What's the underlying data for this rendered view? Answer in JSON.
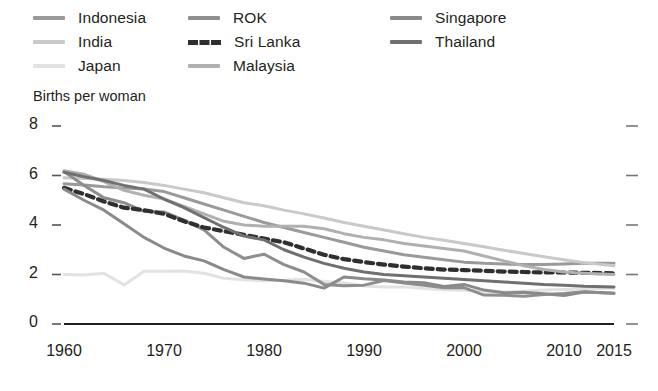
{
  "legend": {
    "columns": [
      {
        "items": [
          {
            "label": "Indonesia",
            "color": "#9a9a9a",
            "style": "solid"
          },
          {
            "label": "India",
            "color": "#c9c9c9",
            "style": "solid"
          },
          {
            "label": "Japan",
            "color": "#e2e2e2",
            "style": "solid"
          }
        ]
      },
      {
        "items": [
          {
            "label": "ROK",
            "color": "#8e8e8e",
            "style": "solid"
          },
          {
            "label": "Sri Lanka",
            "color": "#2f2f2f",
            "style": "dashed"
          },
          {
            "label": "Malaysia",
            "color": "#b0b0b0",
            "style": "solid"
          }
        ]
      },
      {
        "items": [
          {
            "label": "Singapore",
            "color": "#8a8a8a",
            "style": "solid"
          },
          {
            "label": "Thailand",
            "color": "#707070",
            "style": "solid"
          }
        ]
      }
    ]
  },
  "axes": {
    "y_title": "Births per woman",
    "y_ticks": [
      "0",
      "2",
      "4",
      "6",
      "8"
    ],
    "x_ticks": [
      "1960",
      "1970",
      "1980",
      "1990",
      "2000",
      "2010",
      "2015"
    ]
  },
  "chart_data": {
    "type": "line",
    "title": "",
    "subtitle": "",
    "xlabel": "",
    "ylabel": "Births per woman",
    "xlim": [
      1960,
      2015
    ],
    "ylim": [
      0,
      8
    ],
    "grid": false,
    "legend_position": "top",
    "x": [
      1960,
      1962,
      1964,
      1966,
      1968,
      1970,
      1972,
      1974,
      1976,
      1978,
      1980,
      1982,
      1984,
      1986,
      1988,
      1990,
      1992,
      1994,
      1996,
      1998,
      2000,
      2002,
      2004,
      2006,
      2008,
      2010,
      2012,
      2015
    ],
    "series": [
      {
        "name": "Indonesia",
        "color": "#9a9a9a",
        "style": "solid",
        "values": [
          5.67,
          5.62,
          5.55,
          5.5,
          5.45,
          5.35,
          5.1,
          4.85,
          4.6,
          4.35,
          4.1,
          3.9,
          3.7,
          3.5,
          3.3,
          3.1,
          2.95,
          2.8,
          2.7,
          2.6,
          2.5,
          2.45,
          2.42,
          2.4,
          2.4,
          2.42,
          2.45,
          2.45
        ]
      },
      {
        "name": "India",
        "color": "#c9c9c9",
        "style": "solid",
        "values": [
          5.91,
          5.88,
          5.85,
          5.8,
          5.72,
          5.6,
          5.45,
          5.3,
          5.1,
          4.9,
          4.78,
          4.6,
          4.45,
          4.28,
          4.1,
          3.95,
          3.8,
          3.65,
          3.5,
          3.38,
          3.25,
          3.12,
          2.98,
          2.85,
          2.72,
          2.6,
          2.48,
          2.35
        ]
      },
      {
        "name": "Japan",
        "color": "#e2e2e2",
        "style": "solid",
        "values": [
          2.0,
          1.98,
          2.05,
          1.58,
          2.13,
          2.13,
          2.14,
          2.05,
          1.85,
          1.79,
          1.75,
          1.77,
          1.81,
          1.72,
          1.66,
          1.54,
          1.5,
          1.5,
          1.43,
          1.38,
          1.36,
          1.32,
          1.29,
          1.32,
          1.37,
          1.39,
          1.41,
          1.45
        ]
      },
      {
        "name": "ROK",
        "color": "#8e8e8e",
        "style": "solid",
        "values": [
          6.16,
          5.6,
          5.1,
          4.9,
          4.55,
          4.53,
          4.2,
          3.8,
          3.1,
          2.65,
          2.82,
          2.4,
          2.1,
          1.6,
          1.55,
          1.57,
          1.76,
          1.66,
          1.57,
          1.46,
          1.47,
          1.17,
          1.16,
          1.12,
          1.19,
          1.23,
          1.3,
          1.24
        ]
      },
      {
        "name": "Sri Lanka",
        "color": "#2f2f2f",
        "style": "dashed",
        "values": [
          5.5,
          5.25,
          4.95,
          4.7,
          4.6,
          4.45,
          4.15,
          3.9,
          3.75,
          3.6,
          3.45,
          3.3,
          3.05,
          2.8,
          2.62,
          2.5,
          2.4,
          2.32,
          2.25,
          2.2,
          2.18,
          2.15,
          2.12,
          2.1,
          2.08,
          2.08,
          2.07,
          2.05
        ]
      },
      {
        "name": "Malaysia",
        "color": "#b0b0b0",
        "style": "solid",
        "values": [
          6.19,
          6.05,
          5.75,
          5.4,
          5.2,
          5.05,
          4.75,
          4.45,
          4.15,
          4.0,
          3.95,
          3.95,
          3.95,
          3.85,
          3.65,
          3.5,
          3.4,
          3.25,
          3.15,
          3.05,
          2.95,
          2.75,
          2.55,
          2.35,
          2.2,
          2.1,
          2.05,
          2.0
        ]
      },
      {
        "name": "Singapore",
        "color": "#8a8a8a",
        "style": "solid",
        "values": [
          5.45,
          5.0,
          4.6,
          4.05,
          3.5,
          3.07,
          2.75,
          2.55,
          2.2,
          1.9,
          1.82,
          1.75,
          1.65,
          1.45,
          1.9,
          1.83,
          1.78,
          1.7,
          1.67,
          1.52,
          1.6,
          1.37,
          1.26,
          1.28,
          1.22,
          1.15,
          1.29,
          1.24
        ]
      },
      {
        "name": "Thailand",
        "color": "#707070",
        "style": "solid",
        "values": [
          6.13,
          5.95,
          5.8,
          5.6,
          5.45,
          5.05,
          4.7,
          4.3,
          3.9,
          3.55,
          3.4,
          3.0,
          2.7,
          2.45,
          2.25,
          2.1,
          2.0,
          1.95,
          1.9,
          1.85,
          1.8,
          1.75,
          1.7,
          1.65,
          1.6,
          1.57,
          1.53,
          1.5
        ]
      }
    ]
  }
}
